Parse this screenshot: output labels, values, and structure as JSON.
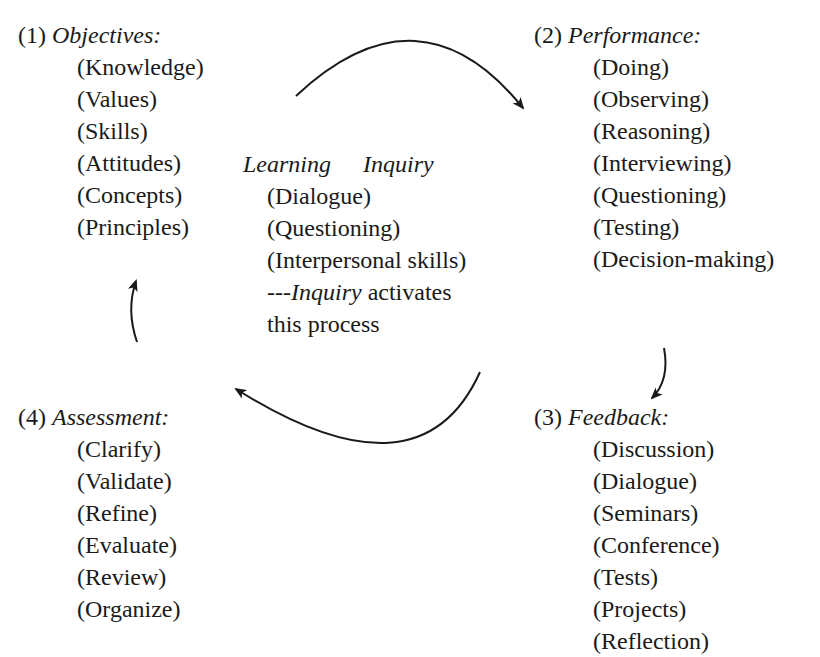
{
  "stages": [
    {
      "number": "(1)",
      "title": "Objectives:",
      "items": [
        "(Knowledge)",
        "(Values)",
        "(Skills)",
        "(Attitudes)",
        "(Concepts)",
        "(Principles)"
      ]
    },
    {
      "number": "(2)",
      "title": "Performance:",
      "items": [
        "(Doing)",
        "(Observing)",
        "(Reasoning)",
        "(Interviewing)",
        "(Questioning)",
        "(Testing)",
        "(Decision-making)"
      ]
    },
    {
      "number": "(3)",
      "title": "Feedback:",
      "items": [
        "(Discussion)",
        "(Dialogue)",
        "(Seminars)",
        "(Conference)",
        "(Tests)",
        "(Projects)",
        "(Reflection)"
      ]
    },
    {
      "number": "(4)",
      "title": "Assessment:",
      "items": [
        "(Clarify)",
        "(Validate)",
        "(Refine)",
        "(Evaluate)",
        "(Review)",
        "(Organize)"
      ]
    }
  ],
  "center": {
    "title_left": "Learning",
    "title_right": "Inquiry",
    "items": [
      "(Dialogue)",
      "(Questioning)",
      "(Interpersonal skills)"
    ],
    "note_prefix": "---",
    "note_italic": "Inquiry",
    "note_rest": " activates",
    "note_line2": "this process"
  },
  "arrows": [
    {
      "from": "Objectives",
      "to": "Performance",
      "direction": "clockwise"
    },
    {
      "from": "Performance",
      "to": "Feedback",
      "direction": "clockwise"
    },
    {
      "from": "Feedback",
      "to": "Assessment",
      "direction": "clockwise"
    },
    {
      "from": "Assessment",
      "to": "Objectives",
      "direction": "clockwise"
    }
  ],
  "colors": {
    "text": "#1a1a1a",
    "background": "#ffffff"
  }
}
